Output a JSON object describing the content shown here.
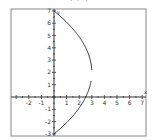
{
  "title": "(a, b)",
  "chart_data": {
    "type": "line",
    "title": "",
    "xlabel": "x",
    "ylabel": "y",
    "xlim": [
      -3,
      7
    ],
    "ylim": [
      -3,
      7
    ],
    "grid": false,
    "x_ticks": [
      -2,
      -1,
      1,
      2,
      3,
      4,
      5,
      6,
      7
    ],
    "y_ticks": [
      -3,
      -2,
      -1,
      1,
      2,
      3,
      4,
      5,
      6,
      7
    ],
    "series": [
      {
        "name": "upper branch",
        "description": "x = 3 - 3(y-2)^2/25, y from 2.2 to 7",
        "points": [
          [
            3.0,
            2.2
          ],
          [
            2.95,
            3
          ],
          [
            2.75,
            4
          ],
          [
            2.4,
            5
          ],
          [
            1.9,
            6
          ],
          [
            1.2,
            6.5
          ],
          [
            0,
            7
          ]
        ]
      },
      {
        "name": "lower branch",
        "description": "x = 3 - 3(y-2)^2/25, y from -3 to 1.3",
        "points": [
          [
            2.95,
            1.3
          ],
          [
            2.88,
            1
          ],
          [
            2.52,
            0
          ],
          [
            1.92,
            -1
          ],
          [
            1.08,
            -2
          ],
          [
            0,
            -3
          ]
        ]
      }
    ]
  }
}
